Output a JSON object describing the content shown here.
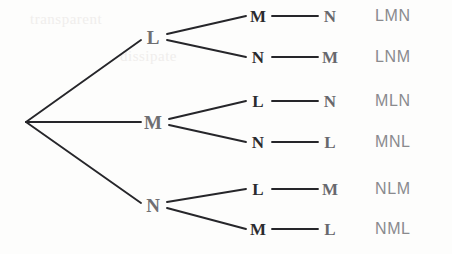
{
  "diagram": {
    "type": "tree",
    "root": {
      "x": 26,
      "y": 122,
      "label": ""
    },
    "level1": [
      {
        "id": "l1-l",
        "label": "L",
        "x": 153,
        "y": 37
      },
      {
        "id": "l1-m",
        "label": "M",
        "x": 153,
        "y": 122
      },
      {
        "id": "l1-n",
        "label": "N",
        "x": 153,
        "y": 205
      }
    ],
    "level2": [
      {
        "id": "l2-lm",
        "label": "M",
        "x": 258,
        "y": 16,
        "parent": "l1-l"
      },
      {
        "id": "l2-ln",
        "label": "N",
        "x": 258,
        "y": 57,
        "parent": "l1-l"
      },
      {
        "id": "l2-ml",
        "label": "L",
        "x": 258,
        "y": 101,
        "parent": "l1-m"
      },
      {
        "id": "l2-mn",
        "label": "N",
        "x": 258,
        "y": 142,
        "parent": "l1-m"
      },
      {
        "id": "l2-nl",
        "label": "L",
        "x": 258,
        "y": 189,
        "parent": "l1-n"
      },
      {
        "id": "l2-nm",
        "label": "M",
        "x": 258,
        "y": 229,
        "parent": "l1-n"
      }
    ],
    "level3": [
      {
        "id": "l3-lmn",
        "label": "N",
        "x": 330,
        "y": 16,
        "parent": "l2-lm"
      },
      {
        "id": "l3-lnm",
        "label": "M",
        "x": 330,
        "y": 57,
        "parent": "l2-ln"
      },
      {
        "id": "l3-mln",
        "label": "N",
        "x": 330,
        "y": 101,
        "parent": "l2-ml"
      },
      {
        "id": "l3-mnl",
        "label": "L",
        "x": 330,
        "y": 142,
        "parent": "l2-mn"
      },
      {
        "id": "l3-nlm",
        "label": "M",
        "x": 330,
        "y": 189,
        "parent": "l2-nl"
      },
      {
        "id": "l3-nml",
        "label": "L",
        "x": 330,
        "y": 229,
        "parent": "l2-nm"
      }
    ],
    "outcomes": [
      {
        "id": "outcome-lmn",
        "label": "LMN",
        "x": 375,
        "y": 16
      },
      {
        "id": "outcome-lnm",
        "label": "LNM",
        "x": 375,
        "y": 57
      },
      {
        "id": "outcome-mln",
        "label": "MLN",
        "x": 375,
        "y": 101
      },
      {
        "id": "outcome-mnl",
        "label": "MNL",
        "x": 375,
        "y": 142
      },
      {
        "id": "outcome-nlm",
        "label": "NLM",
        "x": 375,
        "y": 189
      },
      {
        "id": "outcome-nml",
        "label": "NML",
        "x": 375,
        "y": 229
      }
    ],
    "colors": {
      "background": "#fdfdfc",
      "branch_line": "#26262a",
      "level1_text": "#6f6f72",
      "level2_text": "#2b2b2e",
      "level3_text": "#68686c",
      "outcome_text": "#8a8a8e"
    },
    "artifacts": [
      {
        "text": "transparent",
        "x": 30,
        "y": 18
      },
      {
        "text": "dissipate",
        "x": 120,
        "y": 55
      }
    ]
  }
}
